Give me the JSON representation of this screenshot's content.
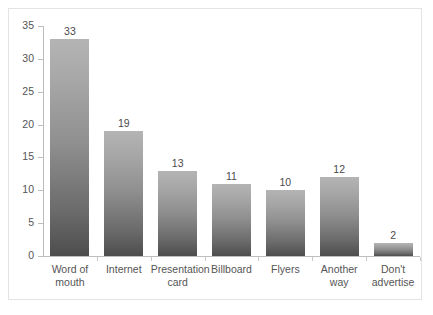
{
  "chart_data": {
    "type": "bar",
    "title": "",
    "subtitle": "",
    "xlabel": "",
    "ylabel": "",
    "categories": [
      "Word of\nmouth",
      "Internet",
      "Presentation\ncard",
      "Billboard",
      "Flyers",
      "Another way",
      "Don't\nadvertise"
    ],
    "values": [
      33,
      19,
      13,
      11,
      10,
      12,
      2
    ],
    "data_labels": [
      "33",
      "19",
      "13",
      "11",
      "10",
      "12",
      "2"
    ],
    "ylim": [
      0,
      35
    ],
    "y_ticks": [
      0,
      5,
      10,
      15,
      20,
      25,
      30,
      35
    ],
    "y_tick_labels": [
      "0",
      "5",
      "10",
      "15",
      "20",
      "25",
      "30",
      "35"
    ],
    "grid": false,
    "legend": false,
    "legend_position": "none",
    "series": [
      {
        "name": "Responses",
        "values": [
          33,
          19,
          13,
          11,
          10,
          12,
          2
        ]
      }
    ]
  },
  "style": {
    "bar_color_top": "#b4b4b4",
    "bar_color_bottom": "#4d4d4d",
    "axis_color": "#bdbdbd",
    "text_color": "#555555",
    "value_text_color": "#4a4a4a",
    "background": "#ffffff",
    "frame_color": "#e3e3e3"
  }
}
